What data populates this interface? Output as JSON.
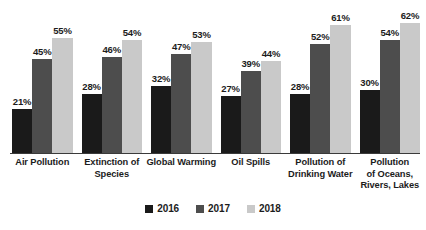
{
  "chart_data": {
    "type": "bar",
    "title": "",
    "subtitle": "",
    "xlabel": "",
    "ylabel": "",
    "ylim": [
      0,
      70
    ],
    "grid": false,
    "legend_position": "bottom-center",
    "value_suffix": "%",
    "categories": [
      "Air Pollution",
      "Extinction of Species",
      "Global Warming",
      "Oil Spills",
      "Pollution of Drinking Water",
      "Pollution of Oceans, Rivers, Lakes"
    ],
    "category_lines": [
      [
        "Air Pollution"
      ],
      [
        "Extinction of",
        "Species"
      ],
      [
        "Global Warming"
      ],
      [
        "Oil Spills"
      ],
      [
        "Pollution of",
        "Drinking Water"
      ],
      [
        "Pollution",
        "of Oceans,",
        "Rivers, Lakes"
      ]
    ],
    "series": [
      {
        "name": "2016",
        "color": "#1a1a1a",
        "values": [
          21,
          28,
          32,
          27,
          28,
          30
        ],
        "labels": [
          "21%",
          "28%",
          "32%",
          "27%",
          "28%",
          "30%"
        ]
      },
      {
        "name": "2017",
        "color": "#4d4d4d",
        "values": [
          45,
          46,
          47,
          39,
          52,
          54
        ],
        "labels": [
          "45%",
          "46%",
          "47%",
          "39%",
          "52%",
          "54%"
        ]
      },
      {
        "name": "2018",
        "color": "#c9c9c9",
        "values": [
          55,
          54,
          53,
          44,
          61,
          62
        ],
        "labels": [
          "55%",
          "54%",
          "53%",
          "44%",
          "61%",
          "62%"
        ]
      }
    ]
  },
  "legend": {
    "items": [
      {
        "label": "2016",
        "color": "#1a1a1a"
      },
      {
        "label": "2017",
        "color": "#4d4d4d"
      },
      {
        "label": "2018",
        "color": "#c9c9c9"
      }
    ]
  },
  "axis": {
    "baseline_color": "#3a3a3a"
  }
}
